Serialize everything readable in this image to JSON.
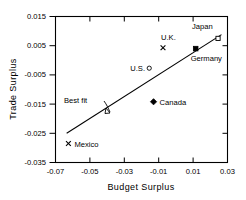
{
  "chart_data": {
    "type": "scatter",
    "title": "",
    "xlabel": "Budget Surplus",
    "ylabel": "Trade Surplus",
    "xlim": [
      -0.07,
      0.03
    ],
    "ylim": [
      -0.035,
      0.015
    ],
    "xticks": [
      "-0.07",
      "-0.05",
      "-0.03",
      "-0.01",
      "0.01",
      "0.03"
    ],
    "xtick_values": [
      -0.07,
      -0.05,
      -0.03,
      -0.01,
      0.01,
      0.03
    ],
    "yticks": [
      "0.015",
      "0.005",
      "-0.005",
      "-0.015",
      "-0.025",
      "-0.035"
    ],
    "ytick_values": [
      0.015,
      0.005,
      -0.005,
      -0.015,
      -0.025,
      -0.035
    ],
    "grid": false,
    "legend": "none",
    "points": [
      {
        "label": "Japan",
        "x": 0.0245,
        "y": 0.0075,
        "marker": "open-square",
        "label_dx": -26,
        "label_dy": -9
      },
      {
        "label": "Germany",
        "x": 0.0115,
        "y": 0.004,
        "marker": "filled-square",
        "label_dx": -5,
        "label_dy": 12
      },
      {
        "label": "U.K.",
        "x": -0.0075,
        "y": 0.0043,
        "marker": "cross",
        "label_dx": -2,
        "label_dy": -8
      },
      {
        "label": "U.S.",
        "x": -0.0155,
        "y": -0.0027,
        "marker": "open-circle",
        "label_dx": -19,
        "label_dy": 3
      },
      {
        "label": "Canada",
        "x": -0.013,
        "y": -0.0142,
        "marker": "filled-diamond",
        "label_dx": 6,
        "label_dy": 3
      },
      {
        "label": "Mexico",
        "x": -0.0625,
        "y": -0.0285,
        "marker": "cross",
        "label_dx": 6,
        "label_dy": 3
      }
    ],
    "fit_line": {
      "label": "Best  fit",
      "x_start": -0.0635,
      "y_start": -0.025,
      "x_end": 0.0265,
      "y_end": 0.0088
    }
  }
}
